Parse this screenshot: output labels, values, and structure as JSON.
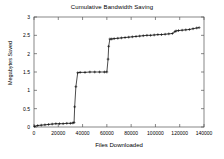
{
  "chart_data": {
    "type": "line",
    "title": "Cumulative Bandwidth Saving",
    "xlabel": "Files Downloaded",
    "ylabel": "Megabytes Saved",
    "xlim": [
      0,
      140000
    ],
    "ylim": [
      0,
      3
    ],
    "grid": false,
    "legend": "none",
    "marker": "plus",
    "xticks": [
      0,
      20000,
      40000,
      60000,
      80000,
      100000,
      120000,
      140000
    ],
    "xtick_labels": [
      "0",
      "20000",
      "40000",
      "60000",
      "80000",
      "100000",
      "120000",
      "140000"
    ],
    "yticks": [
      0,
      0.5,
      1,
      1.5,
      2,
      2.5,
      3
    ],
    "ytick_labels": [
      "0",
      "0.5",
      "1",
      "1.5",
      "2",
      "2.5",
      "3"
    ],
    "series": [
      {
        "name": "Cumulative Bandwidth Saving",
        "x": [
          500,
          3000,
          6000,
          9000,
          12000,
          15000,
          18000,
          21000,
          24000,
          27000,
          30000,
          32000,
          33000,
          33500,
          34500,
          36000,
          38000,
          42000,
          46000,
          50000,
          54000,
          58000,
          60000,
          61000,
          61500,
          62500,
          64000,
          66000,
          69000,
          72000,
          75000,
          78000,
          81000,
          84000,
          87000,
          90000,
          93000,
          96000,
          99000,
          102000,
          105000,
          108000,
          111000,
          114000,
          116000,
          117000,
          119000,
          122000,
          125000,
          128000,
          131000,
          134000,
          136000
        ],
        "y": [
          0.02,
          0.04,
          0.05,
          0.06,
          0.07,
          0.08,
          0.09,
          0.09,
          0.09,
          0.1,
          0.1,
          0.11,
          0.12,
          0.55,
          1.1,
          1.48,
          1.49,
          1.49,
          1.5,
          1.5,
          1.5,
          1.5,
          1.5,
          1.85,
          2.2,
          2.4,
          2.4,
          2.41,
          2.42,
          2.43,
          2.44,
          2.45,
          2.46,
          2.47,
          2.48,
          2.49,
          2.5,
          2.5,
          2.51,
          2.52,
          2.52,
          2.53,
          2.54,
          2.55,
          2.6,
          2.62,
          2.63,
          2.64,
          2.65,
          2.66,
          2.68,
          2.7,
          2.71
        ],
        "color": "#000000"
      }
    ]
  }
}
